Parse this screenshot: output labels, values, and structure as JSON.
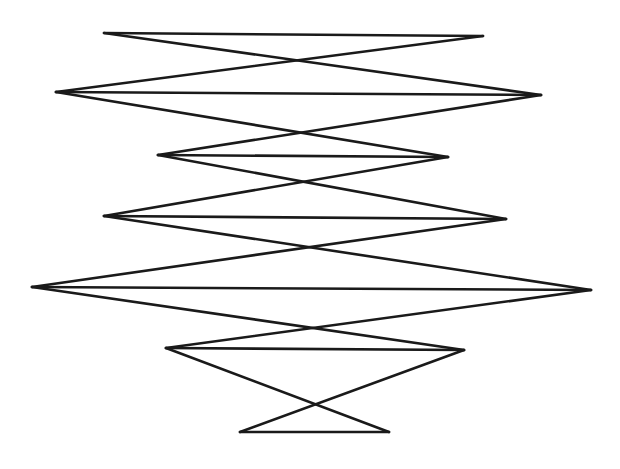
{
  "diagram": {
    "type": "zigzag-line-drawing",
    "stroke_color": "#1a1a1a",
    "background": "#ffffff",
    "rows": [
      {
        "left": [
          104,
          33
        ],
        "right": [
          483,
          36
        ]
      },
      {
        "left": [
          56,
          92
        ],
        "right": [
          541,
          95
        ]
      },
      {
        "left": [
          158,
          155
        ],
        "right": [
          448,
          157
        ]
      },
      {
        "left": [
          104,
          216
        ],
        "right": [
          506,
          219
        ]
      },
      {
        "left": [
          32,
          287
        ],
        "right": [
          591,
          290
        ]
      },
      {
        "left": [
          166,
          348
        ],
        "right": [
          464,
          350
        ]
      },
      {
        "left": [
          240,
          432
        ],
        "right": [
          389,
          432
        ]
      }
    ]
  }
}
